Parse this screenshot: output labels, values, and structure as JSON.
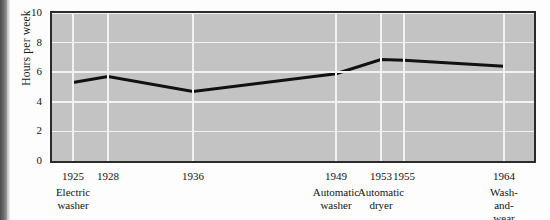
{
  "chart_data": {
    "type": "line",
    "title": "",
    "xlabel": "",
    "ylabel": "Hours per week",
    "ylim": [
      0,
      10
    ],
    "yticks": [
      0,
      2,
      4,
      6,
      8,
      10
    ],
    "ytick_labels": [
      "0",
      "2",
      "4",
      "6",
      "8",
      "10"
    ],
    "grid": true,
    "legend": "none",
    "x": [
      1925,
      1928,
      1936,
      1949,
      1953,
      1955,
      1964
    ],
    "xtick_labels": [
      "1925",
      "1928",
      "1936",
      "1949",
      "1953",
      "1955",
      "1964"
    ],
    "values": [
      5.3,
      5.7,
      4.7,
      5.9,
      6.85,
      6.8,
      6.4
    ],
    "categories": [
      {
        "year": "1925",
        "caption_line1": "Electric",
        "caption_line2": "washer"
      },
      {
        "year": "1928",
        "caption_line1": "",
        "caption_line2": ""
      },
      {
        "year": "1936",
        "caption_line1": "",
        "caption_line2": ""
      },
      {
        "year": "1949",
        "caption_line1": "Automatic",
        "caption_line2": "washer"
      },
      {
        "year": "1953",
        "caption_line1": "Automatic",
        "caption_line2": "dryer"
      },
      {
        "year": "1955",
        "caption_line1": "",
        "caption_line2": ""
      },
      {
        "year": "1964",
        "caption_line1": "Wash-and-",
        "caption_line2": "wear clothing"
      }
    ],
    "annotations": [
      "Electric washer",
      "Automatic washer",
      "Automatic dryer",
      "Wash-and-wear clothing"
    ],
    "colors": {
      "plot_background": "#c3c3c3",
      "gridline": "#f2f2f2",
      "line": "#111111",
      "frame": "#2b2b2b",
      "text": "#141414",
      "page_background": "#fdfdfd"
    }
  },
  "axis": {
    "y_title": "Hours per week"
  }
}
